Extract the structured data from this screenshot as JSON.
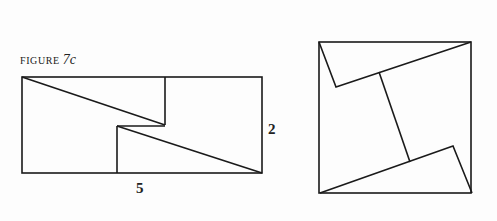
{
  "figure": {
    "caption_prefix": "FIGURE",
    "caption_number": "7c"
  },
  "left_diagram": {
    "label_height": "2",
    "label_width": "5"
  },
  "colors": {
    "stroke": "#1a1a1a",
    "background": "#fdfdfd"
  }
}
